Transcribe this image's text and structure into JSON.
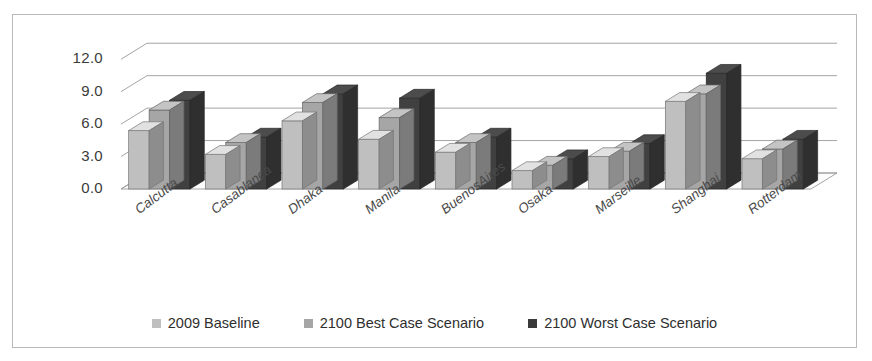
{
  "chart_data": {
    "type": "bar",
    "title": "",
    "xlabel": "",
    "ylabel": "",
    "ylim": [
      0.0,
      13.5
    ],
    "yticks": [
      "0.0",
      "3.0",
      "6.0",
      "9.0",
      "12.0"
    ],
    "ytick_values": [
      0.0,
      3.0,
      6.0,
      9.0,
      12.0
    ],
    "grid": true,
    "three_d": true,
    "legend_position": "bottom",
    "categories": [
      "Calcutta",
      "Casablanca",
      "Dhaka",
      "Manila",
      "BuenosAires",
      "Osaka",
      "Marseille",
      "Shanghai",
      "Rotterdam"
    ],
    "series": [
      {
        "name": "2009 Baseline",
        "color": "#bfbfbf",
        "values": [
          5.4,
          3.2,
          6.3,
          4.6,
          3.4,
          1.7,
          3.0,
          8.1,
          2.8
        ]
      },
      {
        "name": "2100 Best Case Scenario",
        "color": "#a6a6a6",
        "values": [
          7.3,
          4.3,
          8.0,
          6.6,
          4.3,
          2.2,
          3.5,
          8.8,
          3.7
        ]
      },
      {
        "name": "2100 Worst Case Scenario",
        "color": "#404040",
        "values": [
          8.2,
          4.8,
          8.8,
          8.4,
          4.8,
          2.8,
          4.2,
          10.7,
          4.6
        ]
      }
    ]
  },
  "legend": {
    "items": [
      {
        "label": "2009 Baseline",
        "color": "#bfbfbf"
      },
      {
        "label": "2100 Best Case  Scenario",
        "color": "#a6a6a6"
      },
      {
        "label": "2100 Worst Case Scenario",
        "color": "#3a3a3a"
      }
    ]
  },
  "style": {
    "frame_border": "#b9b9b9",
    "background": "#ffffff",
    "gridline": "#9a9a9a",
    "axis_text": "#3b3b3b",
    "category_text": "#4a4a4a"
  }
}
